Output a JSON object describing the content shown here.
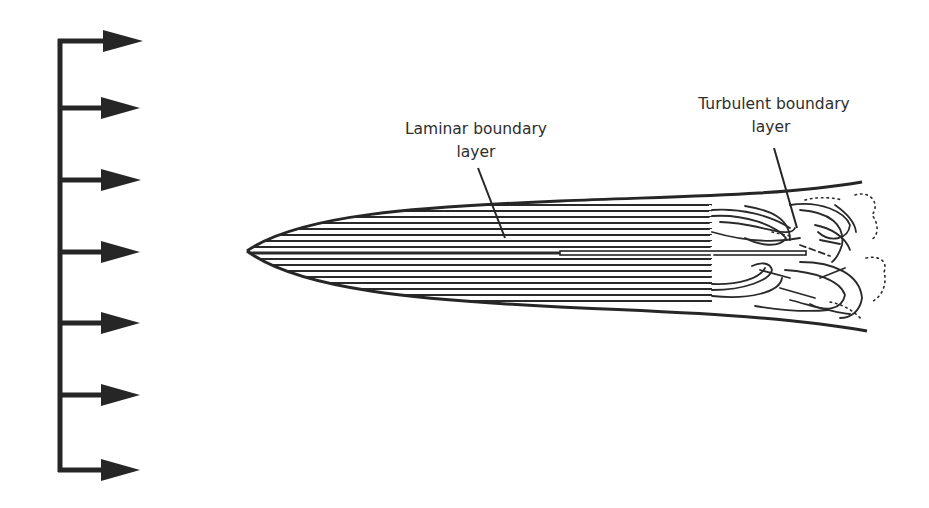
{
  "diagram": {
    "type": "boundary-layer-flow-over-flat-plate",
    "free_stream": {
      "arrow_count": 7,
      "arrow_y": [
        41,
        108,
        180,
        252,
        323,
        395,
        470
      ],
      "description": "uniform free-stream velocity profile"
    },
    "labels": {
      "laminar": {
        "line1": "Laminar boundary",
        "line2": "layer"
      },
      "turbulent": {
        "line1": "Turbulent boundary",
        "line2": "layer"
      }
    },
    "colors": {
      "ink": "#262626",
      "text": "#2e2e2e",
      "background": "#ffffff"
    }
  }
}
